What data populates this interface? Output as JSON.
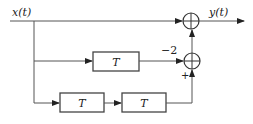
{
  "diagram": {
    "type": "block-diagram",
    "input": {
      "label": "x(t)"
    },
    "output": {
      "label": "y(t)"
    },
    "blocks": [
      {
        "id": "delay-middle",
        "label": "T"
      },
      {
        "id": "delay-bottom-1",
        "label": "T"
      },
      {
        "id": "delay-bottom-2",
        "label": "T"
      }
    ],
    "summers": [
      {
        "id": "sum-top",
        "inputs": [
          "x(t)",
          "sum-middle"
        ]
      },
      {
        "id": "sum-middle",
        "inputs": [
          "delay-middle",
          "delay-bottom-2"
        ]
      }
    ],
    "gains": {
      "middle_gain": "−2",
      "bottom_sign": "+"
    },
    "colors": {
      "line": "#555555",
      "background": "#ffffff"
    }
  }
}
